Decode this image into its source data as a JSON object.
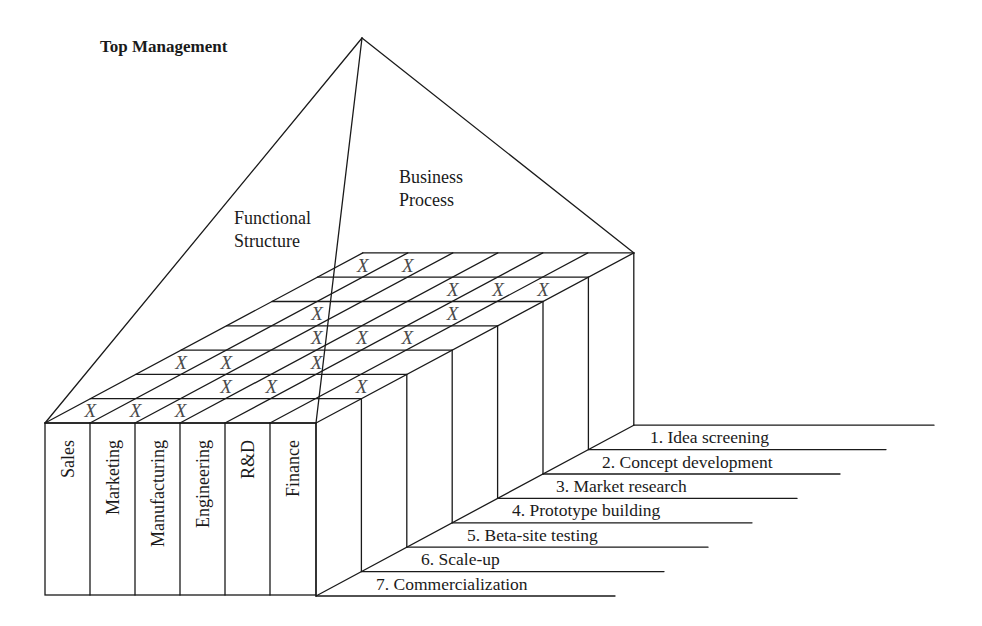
{
  "title": "Top Management",
  "regions": {
    "functional": [
      "Functional",
      "Structure"
    ],
    "business": [
      "Business",
      "Process"
    ]
  },
  "departments": [
    "Sales",
    "Marketing",
    "Manufacturing",
    "Engineering",
    "R&D",
    "Finance"
  ],
  "process_steps": [
    "1. Idea screening",
    "2. Concept development",
    "3. Market research",
    "4. Prototype building",
    "5. Beta-site testing",
    "6. Scale-up",
    "7. Commercialization"
  ],
  "matrix": {
    "mark": "X",
    "rows": [
      {
        "step": "1. Idea screening",
        "cells": [
          "X",
          "X",
          "",
          "",
          "",
          ""
        ]
      },
      {
        "step": "2. Concept development",
        "cells": [
          "",
          "",
          "",
          "X",
          "X",
          "X"
        ]
      },
      {
        "step": "3. Market research",
        "cells": [
          "",
          "X",
          "",
          "",
          "X",
          ""
        ]
      },
      {
        "step": "4. Prototype building",
        "cells": [
          "",
          "",
          "X",
          "X",
          "X",
          ""
        ]
      },
      {
        "step": "5. Beta-site testing",
        "cells": [
          "X",
          "X",
          "",
          "X",
          "",
          ""
        ]
      },
      {
        "step": "6. Scale-up",
        "cells": [
          "",
          "",
          "X",
          "X",
          "",
          "X"
        ]
      },
      {
        "step": "7. Commercialization",
        "cells": [
          "X",
          "X",
          "X",
          "",
          "",
          ""
        ]
      }
    ]
  },
  "colors": {
    "line": "#1a1a1a",
    "mark": "#4a4a4a",
    "background": "#ffffff"
  }
}
